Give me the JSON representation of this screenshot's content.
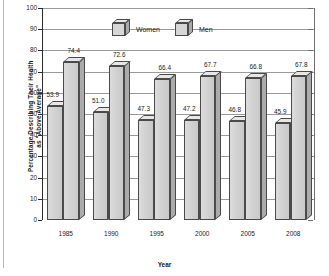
{
  "chart_data": {
    "type": "bar",
    "title": "",
    "xlabel": "Year",
    "ylabel": "Percentage Describing Their Health\nas \"Above Average\"",
    "categories": [
      "1985",
      "1990",
      "1995",
      "2000",
      "2005",
      "2008"
    ],
    "series": [
      {
        "name": "Women",
        "values": [
          53.9,
          51.0,
          47.3,
          47.2,
          46.8,
          45.9
        ]
      },
      {
        "name": "Men",
        "values": [
          74.4,
          72.6,
          66.4,
          67.7,
          66.8,
          67.8
        ]
      }
    ],
    "value_labels": {
      "women": [
        "53.9",
        "51.0",
        "47.3",
        "47.2",
        "46.8",
        "45.9"
      ],
      "men": [
        "74.4",
        "72.6",
        "66.4",
        "67.7",
        "66.8",
        "67.8"
      ]
    },
    "ylim": [
      0,
      100
    ],
    "ytick_values": [
      0,
      10,
      20,
      30,
      40,
      50,
      60,
      70,
      80,
      90,
      100
    ],
    "ytick_labels": [
      "0",
      "10",
      "20",
      "30",
      "40",
      "50",
      "60",
      "70",
      "80",
      "90",
      "100"
    ],
    "grid": "horizontal",
    "legend_position": "top-center",
    "legend": [
      "Women",
      "Men"
    ],
    "colors": {
      "bar_front": "#d4d4d4",
      "bar_side": "#ababab",
      "bar_top": "#e7e7e7",
      "bar_outline": "#4a4a4a",
      "gridline": "#9a9a9a",
      "axis": "#2b2b2b",
      "text": "#1c1c1c",
      "background": "#ffffff"
    }
  },
  "axis": {
    "y_label_line1": "Percentage Describing Their Health",
    "y_label_line2": "as \"Above Average\"",
    "x_label": "Year"
  },
  "legend": {
    "women_label": "Women",
    "men_label": "Men"
  }
}
